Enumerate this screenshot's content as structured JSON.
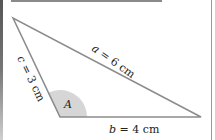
{
  "diagram": {
    "type": "triangle",
    "colors": {
      "stroke": "#8c8c8c",
      "angle_fill": "#d6d6d6",
      "text": "#222222"
    },
    "vertices": {
      "top": [
        13,
        18
      ],
      "bottom_left": [
        60,
        117
      ],
      "bottom_right": [
        201,
        117
      ]
    },
    "angle": {
      "label": "A",
      "radius": 27
    },
    "sides": {
      "a": {
        "var": "a",
        "rest": " = 6 cm",
        "full": "a = 6 cm"
      },
      "b": {
        "var": "b",
        "rest": " = 4 cm",
        "full": "b = 4 cm"
      },
      "c": {
        "var": "c",
        "rest": " = 3 cm",
        "full": "c = 3 cm"
      }
    }
  }
}
